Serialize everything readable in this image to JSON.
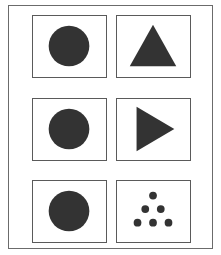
{
  "figure": {
    "rows": 3,
    "columns": 2,
    "fill_color": "#333333",
    "frame_color": "#6b6b6b",
    "cells": [
      {
        "row": 1,
        "col": 1,
        "shape": "circle"
      },
      {
        "row": 1,
        "col": 2,
        "shape": "triangle-up"
      },
      {
        "row": 2,
        "col": 1,
        "shape": "circle"
      },
      {
        "row": 2,
        "col": 2,
        "shape": "triangle-right"
      },
      {
        "row": 3,
        "col": 1,
        "shape": "circle"
      },
      {
        "row": 3,
        "col": 2,
        "shape": "dot-triangle",
        "dot_count": 6
      }
    ]
  }
}
